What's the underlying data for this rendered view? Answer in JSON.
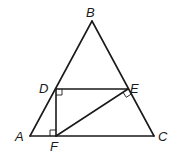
{
  "diagram": {
    "type": "geometry",
    "points": {
      "A": {
        "label": "A",
        "x": 30,
        "y": 136
      },
      "B": {
        "label": "B",
        "x": 92,
        "y": 21
      },
      "C": {
        "label": "C",
        "x": 154,
        "y": 136
      },
      "D": {
        "label": "D",
        "x": 56,
        "y": 89
      },
      "E": {
        "label": "E",
        "x": 128,
        "y": 89
      },
      "F": {
        "label": "F",
        "x": 56,
        "y": 136
      }
    },
    "segments": [
      [
        "A",
        "B"
      ],
      [
        "B",
        "C"
      ],
      [
        "A",
        "C"
      ],
      [
        "D",
        "E"
      ],
      [
        "D",
        "F"
      ],
      [
        "F",
        "E"
      ]
    ],
    "right_angles": [
      {
        "at": "D",
        "between": [
          "E",
          "F"
        ]
      },
      {
        "at": "F",
        "between": [
          "A",
          "D"
        ]
      },
      {
        "at": "E",
        "between": [
          "F",
          "C"
        ]
      }
    ],
    "labels": {
      "A": "A",
      "B": "B",
      "C": "C",
      "D": "D",
      "E": "E",
      "F": "F"
    }
  }
}
